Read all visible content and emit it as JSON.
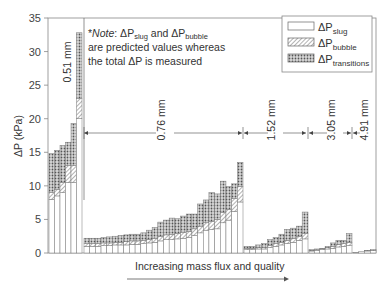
{
  "chart_data": {
    "type": "bar",
    "stacked": true,
    "title": "",
    "xlabel": "Increasing mass flux and quality",
    "ylabel": "ΔP (kPa)",
    "ylim": [
      0,
      35
    ],
    "yticks": [
      0,
      5,
      10,
      15,
      20,
      25,
      30,
      35
    ],
    "grid": false,
    "legend_position": "upper right",
    "legend": [
      {
        "name": "ΔP_slug",
        "pattern": "open"
      },
      {
        "name": "ΔP_bubble",
        "pattern": "hatched"
      },
      {
        "name": "ΔP_transitions",
        "pattern": "crosshatched"
      }
    ],
    "annotation": "*Note: ΔP_slug and ΔP_bubble are predicted values whereas the total ΔP is measured",
    "groups": [
      {
        "name": "0.51 mm",
        "bars": [
          {
            "slug": 8.0,
            "bubble": 1.0,
            "transitions": 5.8
          },
          {
            "slug": 8.5,
            "bubble": 1.0,
            "transitions": 5.8
          },
          {
            "slug": 9.0,
            "bubble": 1.5,
            "transitions": 5.5
          },
          {
            "slug": 10.5,
            "bubble": 2.5,
            "transitions": 3.5
          },
          {
            "slug": 10.5,
            "bubble": 2.5,
            "transitions": 6.3
          },
          {
            "slug": 20.0,
            "bubble": 3.0,
            "transitions": 9.8
          }
        ]
      },
      {
        "name": "0.76 mm",
        "bars": [
          {
            "slug": 1.0,
            "bubble": 0.4,
            "transitions": 0.8
          },
          {
            "slug": 1.0,
            "bubble": 0.4,
            "transitions": 0.8
          },
          {
            "slug": 1.0,
            "bubble": 0.4,
            "transitions": 0.8
          },
          {
            "slug": 1.1,
            "bubble": 0.4,
            "transitions": 0.8
          },
          {
            "slug": 1.1,
            "bubble": 0.4,
            "transitions": 0.9
          },
          {
            "slug": 1.2,
            "bubble": 0.4,
            "transitions": 0.9
          },
          {
            "slug": 1.2,
            "bubble": 0.4,
            "transitions": 1.0
          },
          {
            "slug": 1.2,
            "bubble": 0.5,
            "transitions": 1.0
          },
          {
            "slug": 1.3,
            "bubble": 0.5,
            "transitions": 1.0
          },
          {
            "slug": 1.3,
            "bubble": 0.5,
            "transitions": 1.0
          },
          {
            "slug": 1.4,
            "bubble": 0.5,
            "transitions": 1.1
          },
          {
            "slug": 1.5,
            "bubble": 0.5,
            "transitions": 1.4
          },
          {
            "slug": 1.6,
            "bubble": 0.6,
            "transitions": 1.6
          },
          {
            "slug": 1.8,
            "bubble": 0.7,
            "transitions": 2.1
          },
          {
            "slug": 2.0,
            "bubble": 0.7,
            "transitions": 2.2
          },
          {
            "slug": 2.0,
            "bubble": 0.8,
            "transitions": 2.4
          },
          {
            "slug": 2.1,
            "bubble": 0.8,
            "transitions": 2.2
          },
          {
            "slug": 2.2,
            "bubble": 0.9,
            "transitions": 2.4
          },
          {
            "slug": 2.3,
            "bubble": 0.9,
            "transitions": 2.6
          },
          {
            "slug": 2.6,
            "bubble": 1.0,
            "transitions": 2.2
          },
          {
            "slug": 3.0,
            "bubble": 1.0,
            "transitions": 3.3
          },
          {
            "slug": 3.4,
            "bubble": 1.1,
            "transitions": 3.4
          },
          {
            "slug": 3.5,
            "bubble": 1.2,
            "transitions": 4.3
          },
          {
            "slug": 3.6,
            "bubble": 1.4,
            "transitions": 3.8
          },
          {
            "slug": 4.5,
            "bubble": 1.5,
            "transitions": 4.7
          },
          {
            "slug": 4.9,
            "bubble": 1.6,
            "transitions": 3.4
          },
          {
            "slug": 6.2,
            "bubble": 1.9,
            "transitions": 2.2
          },
          {
            "slug": 7.6,
            "bubble": 2.3,
            "transitions": 3.6
          }
        ]
      },
      {
        "name": "1.52 mm",
        "bars": [
          {
            "slug": 0.5,
            "bubble": 0.2,
            "transitions": 0.3
          },
          {
            "slug": 0.5,
            "bubble": 0.2,
            "transitions": 0.3
          },
          {
            "slug": 0.6,
            "bubble": 0.2,
            "transitions": 0.4
          },
          {
            "slug": 0.6,
            "bubble": 0.2,
            "transitions": 0.6
          },
          {
            "slug": 0.8,
            "bubble": 0.3,
            "transitions": 0.9
          },
          {
            "slug": 1.0,
            "bubble": 0.4,
            "transitions": 0.9
          },
          {
            "slug": 1.2,
            "bubble": 0.4,
            "transitions": 1.2
          },
          {
            "slug": 1.4,
            "bubble": 0.5,
            "transitions": 1.6
          },
          {
            "slug": 1.6,
            "bubble": 0.6,
            "transitions": 1.5
          },
          {
            "slug": 1.9,
            "bubble": 0.6,
            "transitions": 1.5
          },
          {
            "slug": 2.1,
            "bubble": 0.8,
            "transitions": 3.2
          }
        ]
      },
      {
        "name": "3.05 mm",
        "bars": [
          {
            "slug": 0.3,
            "bubble": 0.1,
            "transitions": 0.1
          },
          {
            "slug": 0.4,
            "bubble": 0.1,
            "transitions": 0.1
          },
          {
            "slug": 0.5,
            "bubble": 0.1,
            "transitions": 0.1
          },
          {
            "slug": 0.6,
            "bubble": 0.2,
            "transitions": 0.2
          },
          {
            "slug": 0.7,
            "bubble": 0.3,
            "transitions": 0.5
          },
          {
            "slug": 0.9,
            "bubble": 0.4,
            "transitions": 0.6
          },
          {
            "slug": 1.0,
            "bubble": 0.4,
            "transitions": 0.5
          },
          {
            "slug": 1.1,
            "bubble": 0.5,
            "transitions": 1.3
          }
        ]
      },
      {
        "name": "4.91 mm",
        "bars": [
          {
            "slug": 0.1,
            "bubble": 0.0,
            "transitions": 0.0
          },
          {
            "slug": 0.2,
            "bubble": 0.0,
            "transitions": 0.0
          },
          {
            "slug": 0.3,
            "bubble": 0.0,
            "transitions": 0.1
          },
          {
            "slug": 0.4,
            "bubble": 0.0,
            "transitions": 0.1
          }
        ]
      }
    ]
  },
  "labels": {
    "note_line1_a": "*",
    "note_italic": "Note",
    "note_line1_b": ":  ΔP",
    "note_sub_slug": "slug",
    "note_and": " and  ΔP",
    "note_sub_bubble": "bubble",
    "note_line2": "are predicted values whereas",
    "note_line3": "the total ΔP is measured",
    "legend_slug_main": "ΔP",
    "legend_slug_sub": "slug",
    "legend_bubble_main": "ΔP",
    "legend_bubble_sub": "bubble",
    "legend_trans_main": "ΔP",
    "legend_trans_sub": "transitions",
    "ylabel_main": "ΔP (kPa)",
    "xlabel": "Increasing mass flux and quality",
    "group_labels": [
      "0.51 mm",
      "0.76 mm",
      "1.52 mm",
      "3.05 mm",
      "4.91 mm"
    ],
    "yticks": [
      "0",
      "5",
      "10",
      "15",
      "20",
      "25",
      "30",
      "35"
    ]
  }
}
